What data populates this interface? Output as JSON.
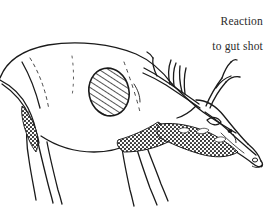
{
  "figure": {
    "background_color": "#ffffff",
    "ink_color": "#1a1a1a",
    "width": 269,
    "height": 211
  },
  "caption": {
    "line1": "Reaction",
    "line2": "to gut shot",
    "full_text": "Reaction to gut shot",
    "align": "right",
    "color": "#2b2b2b"
  },
  "annotations": {
    "vital_zone": {
      "label": "hatched-gut-shot-zone",
      "shape": "oval",
      "hatch_angle_deg": 45,
      "center_x": 109,
      "center_y": 92,
      "radius_x": 20,
      "radius_y": 24
    }
  },
  "parts": [
    {
      "name": "back-and-rump",
      "description": "arched dorsal line cut off at left edge"
    },
    {
      "name": "hind-leg",
      "description": "rear leg descending past bottom edge"
    },
    {
      "name": "front-leg",
      "description": "foreleg descending past bottom edge"
    },
    {
      "name": "belly-line",
      "description": "underbelly curve rising toward brisket"
    },
    {
      "name": "neck-mane",
      "description": "dark stippled shaggy neck mane"
    },
    {
      "name": "head",
      "description": "head lowered, muzzle pointing down-right"
    },
    {
      "name": "antlers",
      "description": "branched antlers sweeping back with upright tines"
    },
    {
      "name": "eye",
      "description": "small dark eye on head"
    },
    {
      "name": "nostril",
      "description": "nostril at muzzle tip"
    }
  ]
}
